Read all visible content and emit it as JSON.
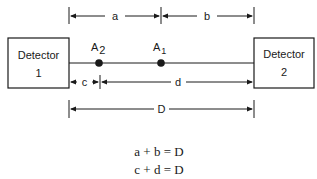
{
  "diagram": {
    "detector1": {
      "line1": "Detector",
      "line2": "1"
    },
    "detector2": {
      "line1": "Detector",
      "line2": "2"
    },
    "points": [
      {
        "label": "A",
        "subscript": "2"
      },
      {
        "label": "A",
        "subscript": "1"
      }
    ],
    "dimensions": {
      "a": "a",
      "b": "b",
      "c": "c",
      "d": "d",
      "D": "D"
    },
    "equations": [
      "a + b = D",
      "c + d = D"
    ],
    "colors": {
      "ink": "#1a1a1a",
      "background": "#ffffff"
    }
  }
}
